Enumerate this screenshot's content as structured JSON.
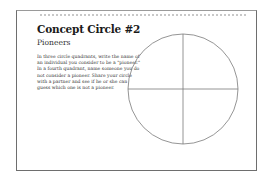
{
  "worksheet": {
    "title": "Concept Circle #2",
    "subtitle": "Pioneers",
    "instructions": "In three circle quadrants, write the name of an individual you consider to be a \"pioneer.\" In a fourth quadrant, name someone you do not consider a pioneer. Share your circle with a partner and see if he or she can guess which one is not a pioneer.",
    "circle": {
      "quadrants": 4,
      "stroke_color": "#7a7a7a"
    },
    "border_color": "#6e6e6e"
  }
}
